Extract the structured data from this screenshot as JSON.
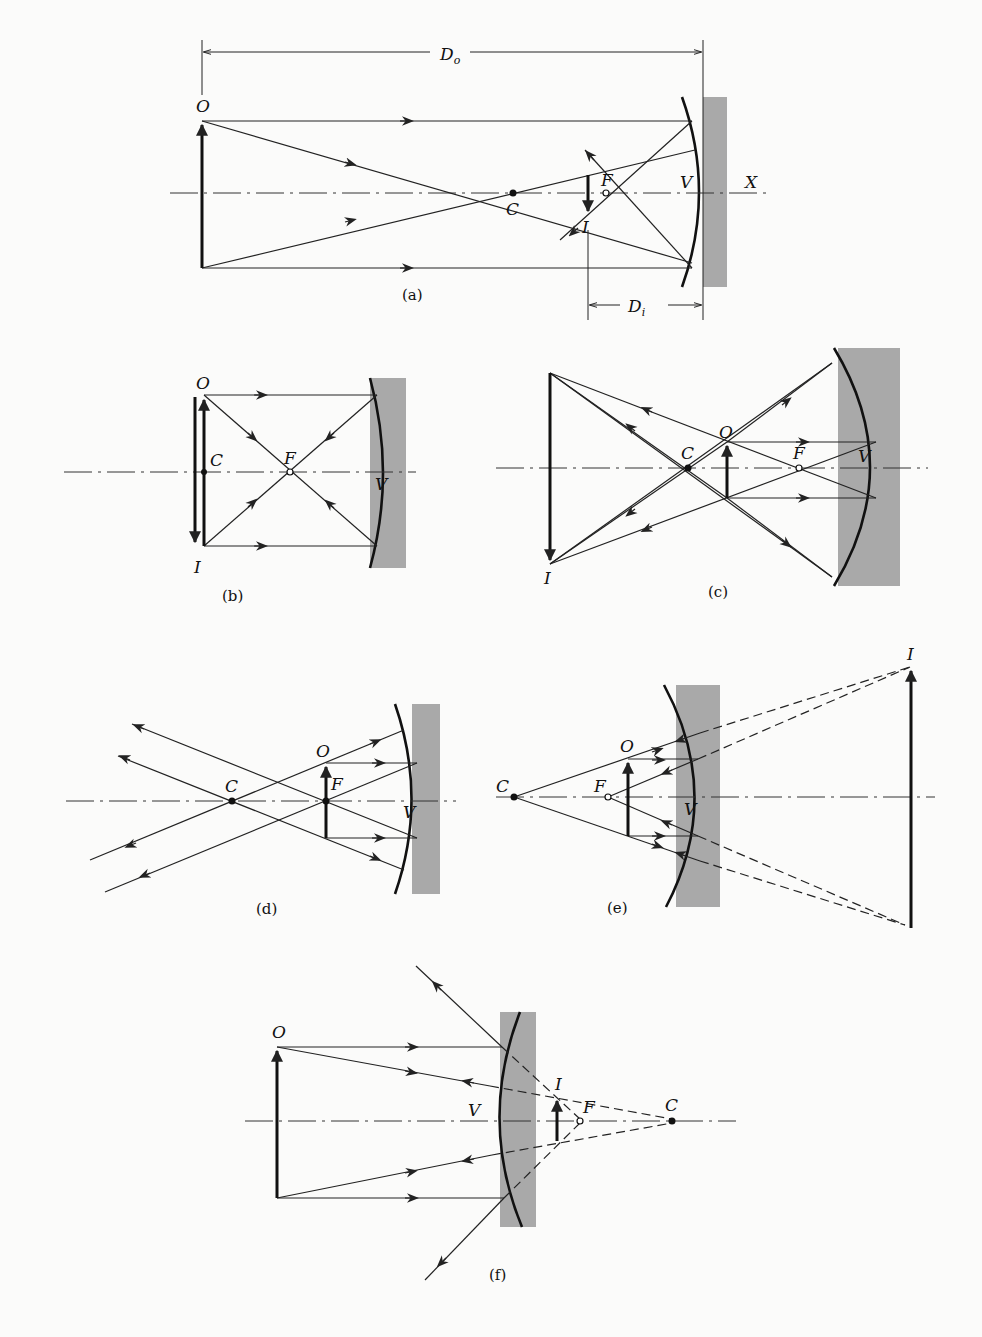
{
  "figure": {
    "colors": {
      "ink": "#111111",
      "mirror_shade": "#a9a9a9",
      "paper": "#fbfbfa"
    },
    "panels": [
      {
        "id": "a",
        "caption": "(a)",
        "mirror": "concave",
        "labels": {
          "object": "O",
          "image": "I",
          "center": "C",
          "focus": "F",
          "vertex": "V",
          "axis_end": "X",
          "object_distance": "D",
          "object_distance_sub": "o",
          "image_distance": "D",
          "image_distance_sub": "i"
        }
      },
      {
        "id": "b",
        "caption": "(b)",
        "mirror": "concave",
        "labels": {
          "object": "O",
          "image": "I",
          "center": "C",
          "focus": "F",
          "vertex": "V"
        }
      },
      {
        "id": "c",
        "caption": "(c)",
        "mirror": "concave",
        "labels": {
          "object": "O",
          "image": "I",
          "center": "C",
          "focus": "F",
          "vertex": "V"
        }
      },
      {
        "id": "d",
        "caption": "(d)",
        "mirror": "concave",
        "labels": {
          "object": "O",
          "center": "C",
          "focus": "F",
          "vertex": "V"
        }
      },
      {
        "id": "e",
        "caption": "(e)",
        "mirror": "concave",
        "labels": {
          "object": "O",
          "image": "I",
          "center": "C",
          "focus": "F",
          "vertex": "V"
        }
      },
      {
        "id": "f",
        "caption": "(f)",
        "mirror": "convex",
        "labels": {
          "object": "O",
          "image": "I",
          "center": "C",
          "focus": "F",
          "vertex": "V"
        }
      }
    ]
  }
}
